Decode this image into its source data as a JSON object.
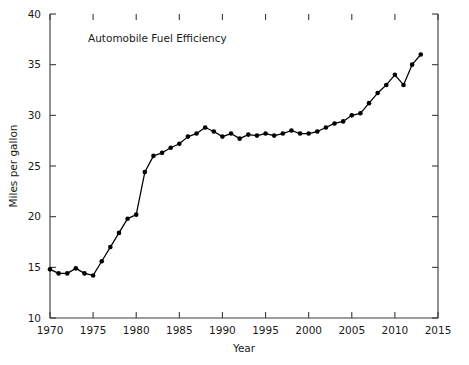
{
  "chart_data": {
    "type": "line",
    "title": "Automobile Fuel Efficiency",
    "xlabel": "Year",
    "ylabel": "Miles per gallon",
    "xlim": [
      1970,
      2015
    ],
    "ylim": [
      10,
      40
    ],
    "xticks": [
      1970,
      1975,
      1980,
      1985,
      1990,
      1995,
      2000,
      2005,
      2010,
      2015
    ],
    "xtick_labels": [
      "1970",
      "1975",
      "1980",
      "1985",
      "1990",
      "1995",
      "2000",
      "2005",
      "2010",
      "2015"
    ],
    "yticks": [
      10,
      15,
      20,
      25,
      30,
      35,
      40
    ],
    "ytick_labels": [
      "10",
      "15",
      "20",
      "25",
      "30",
      "35",
      "40"
    ],
    "grid": false,
    "legend": false,
    "marker": "filled-circle",
    "line_color": "#000000",
    "x": [
      1970,
      1971,
      1972,
      1973,
      1974,
      1975,
      1976,
      1977,
      1978,
      1979,
      1980,
      1981,
      1982,
      1983,
      1984,
      1985,
      1986,
      1987,
      1988,
      1989,
      1990,
      1991,
      1992,
      1993,
      1994,
      1995,
      1996,
      1997,
      1998,
      1999,
      2000,
      2001,
      2002,
      2003,
      2004,
      2005,
      2006,
      2007,
      2008,
      2009,
      2010,
      2011,
      2012,
      2013
    ],
    "values": [
      14.8,
      14.4,
      14.4,
      14.9,
      14.4,
      14.2,
      15.6,
      17.0,
      18.4,
      19.8,
      20.2,
      24.4,
      26.0,
      26.3,
      26.8,
      27.2,
      27.9,
      28.2,
      28.8,
      28.4,
      27.9,
      28.2,
      27.7,
      28.1,
      28.0,
      28.2,
      28.0,
      28.2,
      28.5,
      28.2,
      28.2,
      28.4,
      28.8,
      29.2,
      29.4,
      30.0,
      30.2,
      31.2,
      32.2,
      33.0,
      34.0,
      33.0,
      35.0,
      36.0
    ],
    "series_name": "Automobile fuel efficiency"
  },
  "figure": {
    "background_color": "#ffffff"
  }
}
